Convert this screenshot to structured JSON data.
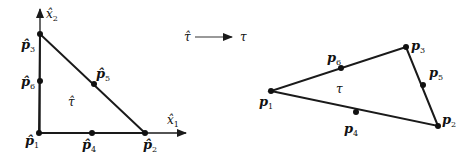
{
  "reference_element": {
    "label": "τ̂",
    "x_axis_label": "x̂",
    "x_axis_sub": "1",
    "y_axis_label": "x̂",
    "y_axis_sub": "2",
    "nodes": [
      {
        "name": "p̂",
        "sub": "1",
        "x": 39,
        "y": 133
      },
      {
        "name": "p̂",
        "sub": "2",
        "x": 145,
        "y": 133
      },
      {
        "name": "p̂",
        "sub": "3",
        "x": 40,
        "y": 34
      },
      {
        "name": "p̂",
        "sub": "4",
        "x": 92,
        "y": 133
      },
      {
        "name": "p̂",
        "sub": "5",
        "x": 94,
        "y": 84
      },
      {
        "name": "p̂",
        "sub": "6",
        "x": 40,
        "y": 81
      }
    ]
  },
  "mapping": {
    "from": "τ̂",
    "to": "τ"
  },
  "physical_element": {
    "label": "τ",
    "nodes": [
      {
        "name": "p",
        "sub": "1",
        "x": 271,
        "y": 91
      },
      {
        "name": "p",
        "sub": "2",
        "x": 438,
        "y": 126
      },
      {
        "name": "p",
        "sub": "3",
        "x": 406,
        "y": 47
      },
      {
        "name": "p",
        "sub": "4",
        "x": 356,
        "y": 112
      },
      {
        "name": "p",
        "sub": "5",
        "x": 423,
        "y": 85
      },
      {
        "name": "p",
        "sub": "6",
        "x": 341,
        "y": 68
      }
    ]
  },
  "colors": {
    "stroke": "#1a1a1a",
    "arrow_line": "#777777",
    "background": "#ffffff"
  }
}
